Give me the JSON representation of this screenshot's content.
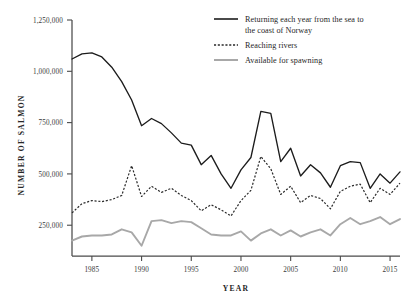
{
  "chart_data": {
    "type": "line",
    "title": "",
    "xlabel": "YEAR",
    "ylabel": "NUMBER OF SALMON",
    "xlim": [
      1983,
      2016
    ],
    "ylim": [
      100000,
      1250000
    ],
    "grid": false,
    "legend_position": "top-right",
    "x_tick_labels": [
      "1985",
      "1990",
      "1995",
      "2000",
      "2005",
      "2010",
      "2015"
    ],
    "x_ticks": [
      1985,
      1990,
      1995,
      2000,
      2005,
      2010,
      2015
    ],
    "y_tick_labels": [
      "250,000",
      "500,000",
      "750,000",
      "1,000,000",
      "1,250,000"
    ],
    "y_ticks": [
      250000,
      500000,
      750000,
      1000000,
      1250000
    ],
    "x": [
      1983,
      1984,
      1985,
      1986,
      1987,
      1988,
      1989,
      1990,
      1991,
      1992,
      1993,
      1994,
      1995,
      1996,
      1997,
      1998,
      1999,
      2000,
      2001,
      2002,
      2003,
      2004,
      2005,
      2006,
      2007,
      2008,
      2009,
      2010,
      2011,
      2012,
      2013,
      2014,
      2015,
      2016
    ],
    "series": [
      {
        "name": "Returning each year from the sea to the coast of Norway",
        "style": "solid",
        "color": "#1c1c1c",
        "values": [
          1060000,
          1085000,
          1090000,
          1070000,
          1020000,
          950000,
          860000,
          735000,
          770000,
          745000,
          700000,
          650000,
          640000,
          545000,
          590000,
          500000,
          430000,
          520000,
          580000,
          805000,
          795000,
          560000,
          625000,
          490000,
          545000,
          505000,
          435000,
          540000,
          560000,
          555000,
          430000,
          500000,
          455000,
          510000
        ]
      },
      {
        "name": "Reaching rivers",
        "style": "dotted",
        "color": "#2a2a2a",
        "values": [
          310000,
          355000,
          370000,
          365000,
          375000,
          395000,
          540000,
          390000,
          440000,
          410000,
          430000,
          395000,
          370000,
          320000,
          350000,
          325000,
          295000,
          370000,
          420000,
          585000,
          525000,
          400000,
          440000,
          360000,
          395000,
          380000,
          330000,
          415000,
          440000,
          450000,
          360000,
          430000,
          400000,
          455000
        ]
      },
      {
        "name": "Available for spawning",
        "style": "solid-gray",
        "color": "#a8a8a8",
        "values": [
          175000,
          195000,
          200000,
          200000,
          205000,
          230000,
          215000,
          150000,
          270000,
          275000,
          260000,
          270000,
          265000,
          235000,
          205000,
          200000,
          200000,
          220000,
          175000,
          210000,
          230000,
          200000,
          225000,
          195000,
          215000,
          230000,
          200000,
          255000,
          285000,
          255000,
          270000,
          290000,
          255000,
          280000
        ]
      }
    ]
  },
  "legend": {
    "items": [
      {
        "label_line1": "Returning each year from the sea to",
        "label_line2": "the coast of Norway",
        "style": "solid"
      },
      {
        "label_line1": "Reaching rivers",
        "label_line2": "",
        "style": "dotted"
      },
      {
        "label_line1": "Available for spawning",
        "label_line2": "",
        "style": "gray"
      }
    ]
  },
  "axes": {
    "y_title": "NUMBER OF SALMON",
    "x_title": "YEAR"
  }
}
